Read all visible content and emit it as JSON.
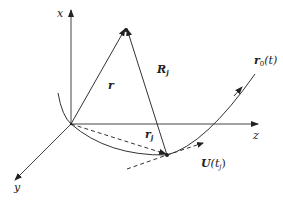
{
  "diagram": {
    "type": "3d-coordinate-vector-diagram",
    "axes": {
      "x": {
        "label": "x"
      },
      "y": {
        "label": "y"
      },
      "z": {
        "label": "z"
      }
    },
    "vectors": {
      "r": {
        "label_main": "r",
        "label_sub": ""
      },
      "R_j": {
        "label_main": "R",
        "label_sub": "j"
      },
      "r_j": {
        "label_main": "r",
        "label_sub": "j"
      }
    },
    "curve": {
      "label_main": "r",
      "label_sub": "0",
      "label_arg": "(t)"
    },
    "tangent": {
      "label_main": "U",
      "label_arg_open": "(t",
      "label_sub": "j",
      "label_arg_close": ")"
    },
    "colors": {
      "line": "#333333",
      "background": "#ffffff"
    }
  }
}
